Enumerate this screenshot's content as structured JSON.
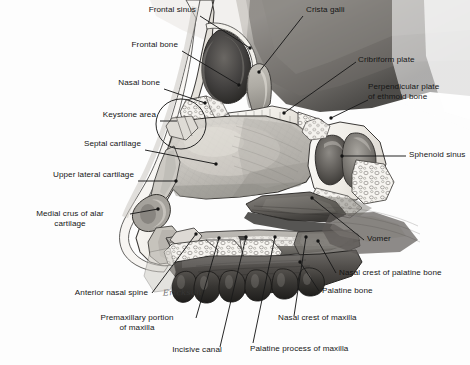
{
  "figure": {
    "width": 470,
    "height": 365,
    "background_color": "#fdfdfd",
    "line_color": "#1a1a1a",
    "text_color": "#151515",
    "style": "grayscale pen-and-ink / airbrush medical illustration",
    "artist_signature": "Erickson"
  },
  "labels": [
    {
      "id": "frontal-sinus",
      "text": "Frontal sinus",
      "side": "left",
      "align": "right",
      "x": 196,
      "y": 9,
      "leader": {
        "from": [
          200,
          16
        ],
        "to": [
          250,
          48
        ]
      },
      "dot": [
        250,
        48
      ]
    },
    {
      "id": "frontal-bone",
      "text": "Frontal bone",
      "side": "left",
      "align": "right",
      "x": 178,
      "y": 44,
      "leader": {
        "from": [
          182,
          51
        ],
        "to": [
          239,
          85
        ]
      },
      "dot": [
        239,
        85
      ]
    },
    {
      "id": "nasal-bone",
      "text": "Nasal bone",
      "side": "left",
      "align": "right",
      "x": 160,
      "y": 82,
      "leader": {
        "from": [
          164,
          89
        ],
        "to": [
          205,
          103
        ]
      },
      "dot": [
        205,
        103
      ]
    },
    {
      "id": "keystone-area",
      "text": "Keystone area",
      "side": "left",
      "align": "right",
      "x": 156,
      "y": 114,
      "leader": {
        "from": [
          160,
          121
        ],
        "to": [
          176,
          121
        ]
      },
      "circle": {
        "cx": 181,
        "cy": 124,
        "r": 25
      }
    },
    {
      "id": "septal-cartilage",
      "text": "Septal cartilage",
      "side": "left",
      "align": "right",
      "x": 141,
      "y": 143,
      "leader": {
        "from": [
          145,
          150
        ],
        "to": [
          216,
          164
        ]
      },
      "dot": [
        216,
        164
      ]
    },
    {
      "id": "upper-lateral-cartilage",
      "text": "Upper lateral cartilage",
      "side": "left",
      "align": "right",
      "x": 134,
      "y": 174,
      "leader": {
        "from": [
          138,
          181
        ],
        "to": [
          175,
          181
        ]
      },
      "dot": [
        175,
        181
      ]
    },
    {
      "id": "medial-crus-of-alar-cartilage",
      "text": "Medial crus of alar\ncartilage",
      "side": "left",
      "align": "right",
      "x": 126,
      "y": 207,
      "leader": {
        "from": [
          130,
          214
        ],
        "to": [
          158,
          209
        ]
      },
      "dot": [
        158,
        209
      ]
    },
    {
      "id": "anterior-nasal-spine",
      "text": "Anterior nasal spine",
      "side": "left",
      "align": "right",
      "x": 148,
      "y": 292,
      "leader": {
        "from": [
          152,
          293
        ],
        "to": [
          196,
          234
        ]
      },
      "dot": [
        196,
        234
      ]
    },
    {
      "id": "premaxillary-portion-of-maxilla",
      "text": "Premaxillary portion\nof maxilla",
      "side": "left",
      "align": "center",
      "x": 144,
      "y": 317,
      "leader": {
        "from": [
          196,
          318
        ],
        "to": [
          219,
          238
        ]
      },
      "dot": [
        219,
        238
      ]
    },
    {
      "id": "incisive-canal",
      "text": "Incisive canal",
      "side": "left",
      "align": "center",
      "x": 185,
      "y": 350,
      "leader": {
        "from": [
          220,
          348
        ],
        "to": [
          246,
          237
        ]
      },
      "dot": [
        246,
        237
      ]
    },
    {
      "id": "palatine-process-of-maxilla",
      "text": "Palatine process of maxilla",
      "side": "left",
      "align": "center",
      "x": 248,
      "y": 348,
      "leader": {
        "from": [
          253,
          344
        ],
        "to": [
          275,
          237
        ]
      },
      "dot": [
        275,
        237
      ]
    },
    {
      "id": "nasal-crest-of-maxilla",
      "text": "Nasal crest of maxilla",
      "side": "right",
      "align": "left",
      "x": 275,
      "y": 317,
      "leader": {
        "from": [
          295,
          316
        ],
        "to": [
          306,
          237
        ]
      },
      "dot": [
        306,
        237
      ]
    },
    {
      "id": "palatine-bone",
      "text": "Palatine bone",
      "side": "right",
      "align": "left",
      "x": 321,
      "y": 289,
      "leader": {
        "from": [
          319,
          291
        ],
        "to": [
          300,
          262
        ]
      },
      "dot": [
        300,
        262
      ]
    },
    {
      "id": "nasal-crest-of-palatine-bone",
      "text": "Nasal crest of palatine bone",
      "side": "right",
      "align": "left",
      "x": 338,
      "y": 271,
      "leader": {
        "from": [
          336,
          273
        ],
        "to": [
          318,
          241
        ]
      },
      "dot": [
        318,
        241
      ]
    },
    {
      "id": "vomer",
      "text": "Vomer",
      "side": "right",
      "align": "left",
      "x": 366,
      "y": 238,
      "leader": {
        "from": [
          364,
          240
        ],
        "to": [
          312,
          198
        ]
      },
      "dot": [
        312,
        198
      ]
    },
    {
      "id": "sphenoid-sinus",
      "text": "Sphenoid sinus",
      "side": "right",
      "align": "left",
      "x": 409,
      "y": 152,
      "leader": {
        "from": [
          406,
          156
        ],
        "to": [
          341,
          156
        ]
      },
      "dot": [
        341,
        156
      ]
    },
    {
      "id": "perpendicular-plate-of-ethmoid-bone",
      "text": "Perpendicular plate\nof ethmoid bone",
      "side": "right",
      "align": "left",
      "x": 369,
      "y": 85,
      "leader": {
        "from": [
          368,
          100
        ],
        "to": [
          330,
          118
        ]
      },
      "dot": [
        330,
        118
      ]
    },
    {
      "id": "cribriform-plate",
      "text": "Cribriform plate",
      "side": "right",
      "align": "left",
      "x": 358,
      "y": 58,
      "leader": {
        "from": [
          356,
          62
        ],
        "to": [
          283,
          113
        ]
      },
      "dot": [
        283,
        113
      ]
    },
    {
      "id": "crista-galli",
      "text": "Crista galli",
      "side": "right",
      "align": "left",
      "x": 305,
      "y": 9,
      "leader": {
        "from": [
          303,
          16
        ],
        "to": [
          258,
          72
        ]
      },
      "dot": [
        258,
        72
      ]
    }
  ],
  "anatomy_regions": [
    {
      "name": "frontal-sinus-cavity",
      "tone": "#4a4a4a"
    },
    {
      "name": "frontal-bone-cortex",
      "tone": "#f2f0ec"
    },
    {
      "name": "nasal-bone",
      "tone": "#eae7e1"
    },
    {
      "name": "septal-cartilage-plate",
      "tone": "#b9b6b1"
    },
    {
      "name": "upper-lateral-cartilage",
      "tone": "#c9c6c0"
    },
    {
      "name": "alar-cartilage-medial-crus",
      "tone": "#8f8c87"
    },
    {
      "name": "perpendicular-plate-ethmoid",
      "tone": "#a9a6a1"
    },
    {
      "name": "cribriform-plate",
      "tone": "#efece6"
    },
    {
      "name": "crista-galli",
      "tone": "#b4b1ac"
    },
    {
      "name": "sphenoid-sinus-cavity",
      "tone": "#5e5b58"
    },
    {
      "name": "vomer",
      "tone": "#6e6b66"
    },
    {
      "name": "palatine-bone",
      "tone": "#7d7a75"
    },
    {
      "name": "maxilla-palatine-process",
      "tone": "#848179"
    },
    {
      "name": "hard-palate-mucosa",
      "tone": "#565350"
    },
    {
      "name": "upper-teeth",
      "tone": "#3f3d3a"
    },
    {
      "name": "cancellous-bone-stipple",
      "tone": "#f5f3ef"
    }
  ]
}
